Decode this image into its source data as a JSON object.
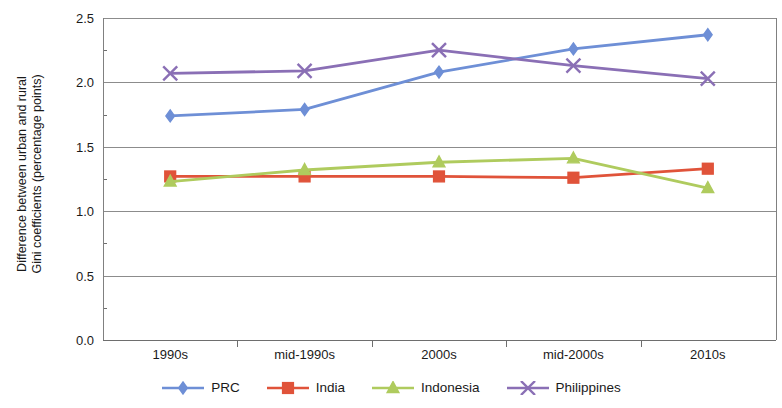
{
  "chart_data": {
    "type": "line",
    "title": "",
    "xlabel": "",
    "ylabel": "Difference between urban and rural Gini coefficients (percentage points)",
    "ylabel_lines": [
      "Difference between urban and rural",
      "Gini coefficients (percentage points)"
    ],
    "categories": [
      "1990s",
      "mid-1990s",
      "2000s",
      "mid-2000s",
      "2010s"
    ],
    "ylim": [
      0.0,
      2.5
    ],
    "yticks": [
      "0.0",
      "0.5",
      "1.0",
      "1.5",
      "2.0",
      "2.5"
    ],
    "ytick_values": [
      0.0,
      0.5,
      1.0,
      1.5,
      2.0,
      2.5
    ],
    "grid": true,
    "legend_position": "bottom",
    "series": [
      {
        "name": "PRC",
        "color": "#6E8FD6",
        "marker": "diamond",
        "values": [
          1.74,
          1.79,
          2.08,
          2.26,
          2.37
        ]
      },
      {
        "name": "India",
        "color": "#E0533A",
        "marker": "square",
        "values": [
          1.27,
          1.27,
          1.27,
          1.26,
          1.33
        ]
      },
      {
        "name": "Indonesia",
        "color": "#AFCB5E",
        "marker": "triangle",
        "values": [
          1.23,
          1.32,
          1.38,
          1.41,
          1.18
        ]
      },
      {
        "name": "Philippines",
        "color": "#8A6FB5",
        "marker": "cross",
        "values": [
          2.07,
          2.09,
          2.25,
          2.13,
          2.03
        ]
      }
    ]
  },
  "legend": {
    "items": [
      {
        "label": "PRC"
      },
      {
        "label": "India"
      },
      {
        "label": "Indonesia"
      },
      {
        "label": "Philippines"
      }
    ]
  }
}
